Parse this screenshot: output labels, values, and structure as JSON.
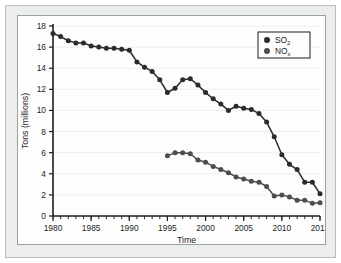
{
  "chart_data": {
    "type": "line",
    "title": "",
    "xlabel": "Time",
    "ylabel": "Tons (millions)",
    "xlim": [
      1980,
      2015
    ],
    "ylim": [
      0,
      18
    ],
    "xticks": [
      1980,
      1985,
      1990,
      1995,
      2000,
      2005,
      2010,
      2015
    ],
    "xtick_labels": [
      "1980",
      "1985",
      "1990",
      "1995",
      "2000",
      "2005",
      "2010",
      "2015"
    ],
    "yticks": [
      0,
      2,
      4,
      6,
      8,
      10,
      12,
      14,
      16,
      18
    ],
    "ytick_labels": [
      "0",
      "2",
      "4",
      "6",
      "8",
      "10",
      "12",
      "14",
      "16",
      "18"
    ],
    "x_minor_tick_interval": 1,
    "grid": "horizontal",
    "legend_position": "top-right",
    "markers": "filled-circle",
    "series": [
      {
        "name": "SO2",
        "label_base": "SO",
        "label_sub": "2",
        "color": "#2b2b2b",
        "x": [
          1980,
          1981,
          1982,
          1983,
          1984,
          1985,
          1986,
          1987,
          1988,
          1989,
          1990,
          1991,
          1992,
          1993,
          1994,
          1995,
          1996,
          1997,
          1998,
          1999,
          2000,
          2001,
          2002,
          2003,
          2004,
          2005,
          2006,
          2007,
          2008,
          2009,
          2010,
          2011,
          2012,
          2013,
          2014
        ],
        "values": [
          17.3,
          17.0,
          16.6,
          16.4,
          16.4,
          16.1,
          16.0,
          15.9,
          15.9,
          15.8,
          15.7,
          14.6,
          14.1,
          13.7,
          12.9,
          11.7,
          12.1,
          12.9,
          13.0,
          12.4,
          11.7,
          11.1,
          10.6,
          10.0,
          10.4,
          10.2,
          10.1,
          9.7,
          8.9,
          7.5,
          5.8,
          4.9,
          4.4,
          3.2,
          3.2
        ]
      },
      {
        "name": "NOx",
        "label_base": "NO",
        "label_sub": "x",
        "color": "#4d4d4d",
        "x": [
          1995,
          1996,
          1997,
          1998,
          1999,
          2000,
          2001,
          2002,
          2003,
          2004,
          2005,
          2006,
          2007,
          2008,
          2009,
          2010,
          2011,
          2012,
          2013,
          2014
        ],
        "values": [
          5.7,
          6.0,
          6.0,
          5.9,
          5.3,
          5.1,
          4.7,
          4.4,
          4.1,
          3.7,
          3.5,
          3.3,
          3.2,
          2.8,
          1.9,
          2.0,
          1.8,
          1.5,
          1.5,
          1.2
        ]
      }
    ],
    "series_endpoints": {
      "so2_last_x": 2015,
      "so2_last_value": 2.1,
      "nox_last_x": 2015,
      "nox_last_value": 1.25
    }
  }
}
